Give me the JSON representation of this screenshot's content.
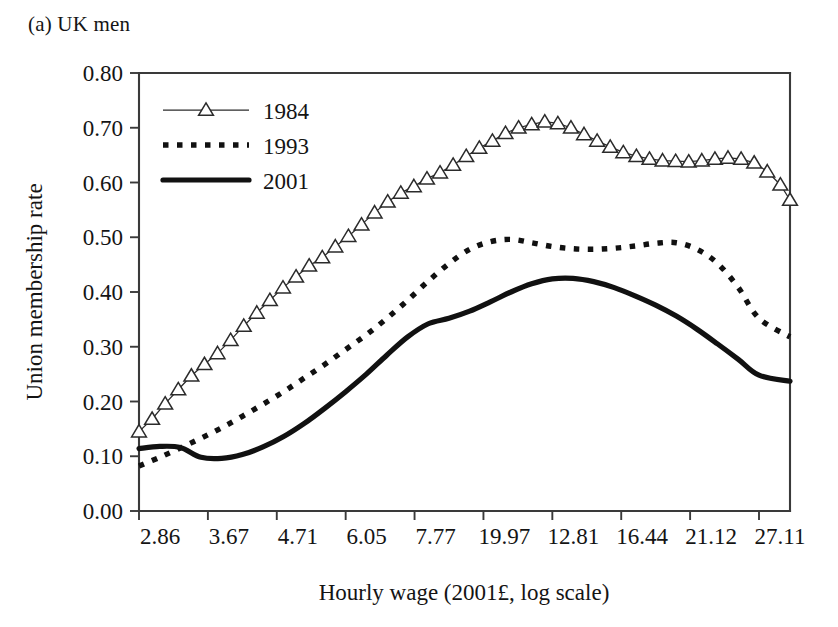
{
  "figure": {
    "panel_caption": "(a) UK men"
  },
  "chart_data": {
    "type": "line",
    "title": "(a) UK men",
    "xlabel": "Hourly wage (2001£, log scale)",
    "ylabel": "Union membership rate",
    "grid": false,
    "legend_position": "top-left inside plot",
    "x_scale": "log",
    "x_tick_labels": [
      "2.86",
      "3.67",
      "4.71",
      "6.05",
      "7.77",
      "19.97",
      "12.81",
      "16.44",
      "21.12",
      "27.11"
    ],
    "x_tick_positions": [
      0,
      1,
      2,
      3,
      4,
      5,
      6,
      7,
      8,
      9
    ],
    "y_tick_labels": [
      "0.00",
      "0.10",
      "0.20",
      "0.30",
      "0.40",
      "0.50",
      "0.60",
      "0.70",
      "0.80"
    ],
    "ylim": [
      0.0,
      0.8
    ],
    "xlim": [
      0,
      9.45
    ],
    "series": [
      {
        "name": "1984",
        "style": "line-with-triangle-markers",
        "color": "#2b2b2b",
        "x": [
          0.0,
          0.19,
          0.38,
          0.57,
          0.76,
          0.95,
          1.14,
          1.33,
          1.52,
          1.71,
          1.9,
          2.09,
          2.28,
          2.47,
          2.66,
          2.85,
          3.04,
          3.23,
          3.42,
          3.61,
          3.8,
          3.99,
          4.18,
          4.37,
          4.56,
          4.75,
          4.94,
          5.13,
          5.32,
          5.51,
          5.7,
          5.89,
          6.08,
          6.27,
          6.46,
          6.65,
          6.84,
          7.03,
          7.22,
          7.41,
          7.6,
          7.79,
          7.98,
          8.17,
          8.36,
          8.55,
          8.74,
          8.93,
          9.12,
          9.31,
          9.45
        ],
        "values": [
          0.145,
          0.168,
          0.196,
          0.222,
          0.247,
          0.268,
          0.288,
          0.312,
          0.338,
          0.362,
          0.385,
          0.408,
          0.428,
          0.448,
          0.463,
          0.483,
          0.502,
          0.523,
          0.545,
          0.565,
          0.581,
          0.593,
          0.607,
          0.618,
          0.632,
          0.648,
          0.663,
          0.676,
          0.69,
          0.7,
          0.706,
          0.711,
          0.708,
          0.7,
          0.688,
          0.676,
          0.665,
          0.655,
          0.648,
          0.643,
          0.64,
          0.639,
          0.638,
          0.64,
          0.643,
          0.645,
          0.643,
          0.636,
          0.62,
          0.596,
          0.568
        ]
      },
      {
        "name": "1984-tail",
        "style": "line-with-triangle-markers-continued",
        "color": "#2b2b2b",
        "x": [
          9.45
        ],
        "values": [
          0.568
        ]
      },
      {
        "name": "1993",
        "style": "dotted",
        "color": "#111111",
        "x": [
          0.0,
          0.3,
          0.6,
          0.9,
          1.2,
          1.5,
          1.8,
          2.1,
          2.4,
          2.7,
          3.0,
          3.3,
          3.6,
          3.9,
          4.2,
          4.5,
          4.8,
          5.1,
          5.4,
          5.7,
          6.0,
          6.3,
          6.6,
          6.9,
          7.2,
          7.5,
          7.8,
          8.1,
          8.4,
          8.7,
          9.0,
          9.45
        ],
        "values": [
          0.082,
          0.098,
          0.115,
          0.133,
          0.152,
          0.173,
          0.195,
          0.218,
          0.243,
          0.268,
          0.295,
          0.322,
          0.352,
          0.385,
          0.42,
          0.452,
          0.478,
          0.492,
          0.496,
          0.49,
          0.483,
          0.479,
          0.478,
          0.48,
          0.484,
          0.489,
          0.49,
          0.478,
          0.452,
          0.408,
          0.352,
          0.318
        ]
      },
      {
        "name": "2001",
        "style": "solid-thick",
        "color": "#111111",
        "x": [
          0.0,
          0.3,
          0.6,
          0.9,
          1.2,
          1.5,
          1.8,
          2.1,
          2.4,
          2.7,
          3.0,
          3.3,
          3.6,
          3.9,
          4.2,
          4.5,
          4.8,
          5.1,
          5.4,
          5.7,
          6.0,
          6.3,
          6.6,
          6.9,
          7.2,
          7.5,
          7.8,
          8.1,
          8.4,
          8.7,
          9.0,
          9.45
        ],
        "values": [
          0.114,
          0.118,
          0.116,
          0.098,
          0.096,
          0.103,
          0.117,
          0.136,
          0.16,
          0.188,
          0.218,
          0.25,
          0.285,
          0.318,
          0.342,
          0.352,
          0.365,
          0.382,
          0.4,
          0.415,
          0.424,
          0.425,
          0.419,
          0.408,
          0.393,
          0.376,
          0.356,
          0.332,
          0.305,
          0.277,
          0.248,
          0.237
        ]
      }
    ],
    "legend": [
      {
        "label": "1984",
        "style": "line-with-triangle-markers"
      },
      {
        "label": "1993",
        "style": "dotted"
      },
      {
        "label": "2001",
        "style": "solid-thick"
      }
    ]
  }
}
